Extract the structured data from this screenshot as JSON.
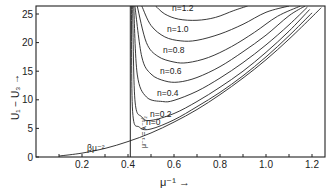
{
  "chart_data": {
    "type": "line",
    "title": "",
    "xlabel": "μ⁻¹ →",
    "ylabel": "U₁ − U₃ →",
    "xlim": [
      0,
      1.25
    ],
    "ylim": [
      0,
      26.4
    ],
    "grid": false,
    "legend": "inline curve labels",
    "x_ticks": [
      0.2,
      0.4,
      0.6,
      0.8,
      1.0,
      1.2
    ],
    "x_tick_labels": [
      "0.2",
      "0.4",
      "0.6",
      "0.8",
      "1.0",
      "1.2"
    ],
    "x_minor_ticks": [
      0.1,
      0.3,
      0.5,
      0.7,
      0.9,
      1.1
    ],
    "y_ticks": [
      0,
      5,
      10,
      15,
      20,
      25
    ],
    "y_tick_labels": [
      "0",
      "5",
      "10",
      "15",
      "20",
      "25"
    ],
    "vertical_line": {
      "x": 0.41,
      "label": "μ⁻¹ = λ⁻¹⁄₂"
    },
    "series": [
      {
        "name": "βμ⁻²",
        "label": "βμ⁻²",
        "x": [
          0.1,
          0.2,
          0.3,
          0.4,
          0.5,
          0.6,
          0.7,
          0.8,
          0.9,
          1.0,
          1.1,
          1.2,
          1.24
        ],
        "y": [
          0.17,
          0.68,
          1.5,
          2.7,
          4.2,
          6.1,
          8.3,
          10.9,
          13.8,
          17.0,
          20.6,
          24.5,
          26.1
        ]
      },
      {
        "name": "n=0",
        "label": "n=0",
        "x": [
          0.415,
          0.42,
          0.45,
          0.5,
          0.6,
          0.7,
          0.8,
          0.9,
          1.0,
          1.1,
          1.2
        ],
        "y": [
          26.4,
          8.0,
          5.2,
          4.9,
          6.5,
          8.8,
          11.3,
          14.2,
          17.5,
          21.2,
          25.2
        ]
      },
      {
        "name": "n=0.2",
        "label": "n=0.2",
        "x": [
          0.42,
          0.43,
          0.46,
          0.5,
          0.6,
          0.7,
          0.8,
          0.9,
          1.0,
          1.1,
          1.19
        ],
        "y": [
          26.4,
          10.0,
          7.0,
          6.4,
          7.6,
          9.7,
          12.2,
          15.0,
          18.3,
          22.0,
          25.8
        ]
      },
      {
        "name": "n=0.4",
        "label": "n=0.4",
        "x": [
          0.425,
          0.44,
          0.48,
          0.55,
          0.6,
          0.7,
          0.8,
          0.9,
          1.0,
          1.1,
          1.18
        ],
        "y": [
          26.4,
          14.5,
          10.5,
          9.7,
          9.9,
          11.5,
          13.8,
          16.5,
          19.6,
          23.1,
          26.2
        ]
      },
      {
        "name": "n=0.6",
        "label": "n=0.6",
        "x": [
          0.43,
          0.46,
          0.5,
          0.56,
          0.62,
          0.7,
          0.8,
          0.9,
          1.0,
          1.1,
          1.17
        ],
        "y": [
          26.4,
          17.5,
          14.5,
          13.3,
          13.1,
          13.9,
          15.8,
          18.4,
          21.3,
          24.7,
          26.4
        ]
      },
      {
        "name": "n=0.8",
        "label": "n=0.8",
        "x": [
          0.44,
          0.48,
          0.53,
          0.6,
          0.66,
          0.75,
          0.85,
          0.95,
          1.05,
          1.15
        ],
        "y": [
          26.4,
          20.0,
          17.6,
          16.6,
          16.5,
          17.4,
          19.3,
          21.8,
          24.6,
          26.4
        ]
      },
      {
        "name": "n=1.0",
        "label": "n=1.0",
        "x": [
          0.46,
          0.5,
          0.56,
          0.63,
          0.7,
          0.8,
          0.9,
          1.0,
          1.1
        ],
        "y": [
          26.4,
          23.0,
          21.0,
          20.3,
          20.4,
          21.5,
          23.2,
          25.3,
          26.4
        ]
      },
      {
        "name": "n=1.2",
        "label": "n=1.2",
        "x": [
          0.52,
          0.56,
          0.62,
          0.7,
          0.78,
          0.86,
          0.92
        ],
        "y": [
          26.4,
          25.0,
          24.1,
          23.9,
          24.4,
          25.6,
          26.4
        ]
      }
    ]
  }
}
